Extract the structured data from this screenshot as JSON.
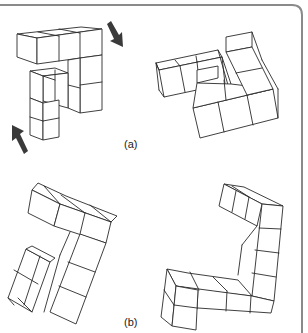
{
  "figure": {
    "frame_color": "#8a8a8a",
    "line_color": "#2a2a2a",
    "arrow_color": "#3a3a3a",
    "panels": [
      {
        "id": "a",
        "label": "(a)",
        "left_figure": "cube-assembly-with-rotation-arrows",
        "right_figure": "rotated-cube-assembly"
      },
      {
        "id": "b",
        "label": "(b)",
        "left_figure": "cube-assembly",
        "right_figure": "rotated-cube-assembly"
      }
    ],
    "arrows": [
      {
        "name": "rotation-arrow-down-right",
        "direction": "down-right"
      },
      {
        "name": "rotation-arrow-up-left",
        "direction": "up-left"
      }
    ]
  }
}
